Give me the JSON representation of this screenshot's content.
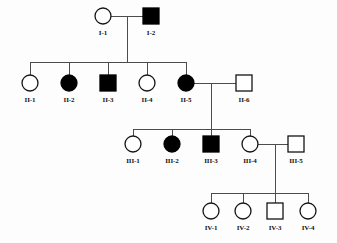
{
  "diagram": {
    "type": "pedigree",
    "background_color": "#fdfdfd",
    "line_color": "#4c4c4c",
    "symbol_outline_color": "#141414",
    "affected_fill_color": "#000000",
    "unaffected_fill_color": "#ffffff"
  },
  "legend_meaning": {
    "circle": "female",
    "square": "male",
    "filled": "affected",
    "open": "unaffected"
  },
  "generations": [
    {
      "name": "I",
      "individuals": [
        {
          "id": "I-1",
          "label": "I-1",
          "sex": "female",
          "shape": "circle",
          "affected": false,
          "x": 103,
          "y": 16
        },
        {
          "id": "I-2",
          "label": "I-2",
          "sex": "male",
          "shape": "square",
          "affected": true,
          "x": 151,
          "y": 16
        }
      ]
    },
    {
      "name": "II",
      "individuals": [
        {
          "id": "II-1",
          "label": "II-1",
          "sex": "female",
          "shape": "circle",
          "affected": false,
          "x": 30,
          "y": 83
        },
        {
          "id": "II-2",
          "label": "II-2",
          "sex": "female",
          "shape": "circle",
          "affected": true,
          "x": 69,
          "y": 83
        },
        {
          "id": "II-3",
          "label": "II-3",
          "sex": "male",
          "shape": "square",
          "affected": true,
          "x": 108,
          "y": 83
        },
        {
          "id": "II-4",
          "label": "II-4",
          "sex": "female",
          "shape": "circle",
          "affected": false,
          "x": 147,
          "y": 83
        },
        {
          "id": "II-5",
          "label": "II-5",
          "sex": "female",
          "shape": "circle",
          "affected": true,
          "x": 186,
          "y": 83
        },
        {
          "id": "II-6",
          "label": "II-6",
          "sex": "male",
          "shape": "square",
          "affected": false,
          "x": 244,
          "y": 83
        }
      ]
    },
    {
      "name": "III",
      "individuals": [
        {
          "id": "III-1",
          "label": "III-1",
          "sex": "female",
          "shape": "circle",
          "affected": false,
          "x": 133,
          "y": 144
        },
        {
          "id": "III-2",
          "label": "III-2",
          "sex": "female",
          "shape": "circle",
          "affected": true,
          "x": 172,
          "y": 144
        },
        {
          "id": "III-3",
          "label": "III-3",
          "sex": "male",
          "shape": "square",
          "affected": true,
          "x": 211,
          "y": 144
        },
        {
          "id": "III-4",
          "label": "III-4",
          "sex": "female",
          "shape": "circle",
          "affected": false,
          "x": 250,
          "y": 144
        },
        {
          "id": "III-5",
          "label": "III-5",
          "sex": "male",
          "shape": "square",
          "affected": false,
          "x": 296,
          "y": 144
        }
      ]
    },
    {
      "name": "IV",
      "individuals": [
        {
          "id": "IV-1",
          "label": "IV-1",
          "sex": "female",
          "shape": "circle",
          "affected": false,
          "x": 211,
          "y": 211
        },
        {
          "id": "IV-2",
          "label": "IV-2",
          "sex": "female",
          "shape": "circle",
          "affected": false,
          "x": 243,
          "y": 211
        },
        {
          "id": "IV-3",
          "label": "IV-3",
          "sex": "male",
          "shape": "square",
          "affected": false,
          "x": 275,
          "y": 211
        },
        {
          "id": "IV-4",
          "label": "IV-4",
          "sex": "female",
          "shape": "circle",
          "affected": false,
          "x": 308,
          "y": 211
        }
      ]
    }
  ],
  "matings": [
    {
      "id": "mating-I1-I2",
      "partners": [
        "I-1",
        "I-2"
      ],
      "mating_line_y": 16,
      "x1": 111,
      "x2": 143,
      "descent_x": 127,
      "sibship_y": 62,
      "children": [
        "II-1",
        "II-2",
        "II-3",
        "II-4",
        "II-5"
      ]
    },
    {
      "id": "mating-II5-II6",
      "partners": [
        "II-5",
        "II-6"
      ],
      "mating_line_y": 83,
      "x1": 194,
      "x2": 236,
      "descent_x": 211,
      "sibship_y": 129,
      "children": [
        "III-1",
        "III-2",
        "III-3",
        "III-4"
      ]
    },
    {
      "id": "mating-III4-III5",
      "partners": [
        "III-4",
        "III-5"
      ],
      "mating_line_y": 144,
      "x1": 258,
      "x2": 288,
      "descent_x": 275,
      "sibship_y": 193,
      "children": [
        "IV-1",
        "IV-2",
        "IV-3",
        "IV-4"
      ]
    }
  ],
  "sibships": [
    {
      "id": "sibship-II",
      "y": 62,
      "x_start": 30,
      "x_end": 186,
      "drop_to_y": 75,
      "child_x": [
        30,
        69,
        108,
        147,
        186
      ]
    },
    {
      "id": "sibship-III",
      "y": 129,
      "x_start": 133,
      "x_end": 250,
      "drop_to_y": 136,
      "child_x": [
        133,
        172,
        211,
        250
      ]
    },
    {
      "id": "sibship-IV",
      "y": 193,
      "x_start": 211,
      "x_end": 308,
      "drop_to_y": 203,
      "child_x": [
        211,
        243,
        275,
        308
      ]
    }
  ],
  "geometry": {
    "circle_radius": 8,
    "square_size": 16,
    "label_offset_y": 19
  }
}
